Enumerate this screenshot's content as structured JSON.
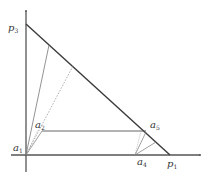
{
  "diagram": {
    "type": "geometric-simplex",
    "colors": {
      "axis": "#555555",
      "hypotenuse": "#3a3a3a",
      "thin_line": "#777777",
      "label": "#333333",
      "background": "#ffffff"
    },
    "labels": {
      "p3": {
        "base": "p",
        "sub": "3"
      },
      "p1": {
        "base": "p",
        "sub": "1"
      },
      "a1": {
        "base": "a",
        "sub": "1"
      },
      "a2": {
        "base": "a",
        "sub": "2"
      },
      "a4": {
        "base": "a",
        "sub": "4"
      },
      "a5": {
        "base": "a",
        "sub": "5"
      }
    },
    "points": {
      "origin": [
        26,
        155
      ],
      "p3": [
        26,
        24
      ],
      "p1": [
        170,
        155
      ],
      "a1": [
        26,
        155
      ],
      "a2": [
        42,
        131
      ],
      "a4": [
        135,
        155
      ],
      "a5": [
        146,
        132
      ],
      "h1": [
        49,
        45
      ],
      "h2": [
        73,
        66
      ]
    }
  }
}
